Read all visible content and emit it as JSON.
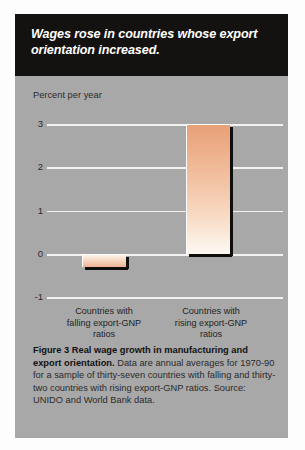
{
  "headline": {
    "line1": "Wages rose in countries whose export",
    "line2": "orientation increased."
  },
  "chart_data": {
    "type": "bar",
    "title": "",
    "ylabel": "Percent per year",
    "xlabel": "",
    "categories": [
      "Countries with falling export-GNP ratios",
      "Countries with rising export-GNP ratios"
    ],
    "category_lines": [
      [
        "Countries with",
        "falling export-GNP",
        "ratios"
      ],
      [
        "Countries with",
        "rising export-GNP",
        "ratios"
      ]
    ],
    "values": [
      -0.3,
      3.0
    ],
    "ylim": [
      -1,
      3
    ],
    "yticks": [
      "3",
      "2",
      "1",
      "0",
      "-1"
    ],
    "ytick_values": [
      3,
      2,
      1,
      0,
      -1
    ],
    "grid": true,
    "legend": "none",
    "bar_color_top": "#e8a077",
    "bar_color_bottom": "#fdf8f2",
    "shadow_color": "#100e0c",
    "plot_background": "#a8a8a8",
    "gridline_color": "#f2f2f2"
  },
  "caption": {
    "bold_lead": "Figure 3  Real wage growth in manufacturing and export orientation.",
    "body": " Data are annual averages for 1970-90 for a sample of thirty-seven countries with falling and thirty-two countries with rising export-GNP ratios. Source: UNIDO and World Bank data."
  }
}
